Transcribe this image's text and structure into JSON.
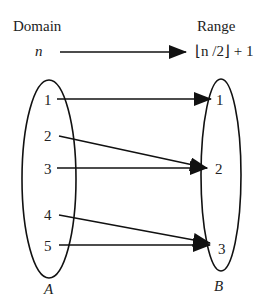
{
  "header": {
    "domain_label": "Domain",
    "range_label": "Range",
    "domain_var": "n",
    "range_expr": "⌊n /2⌋ + 1"
  },
  "sets": {
    "A": {
      "name": "A",
      "elements": [
        "1",
        "2",
        "3",
        "4",
        "5"
      ]
    },
    "B": {
      "name": "B",
      "elements": [
        "1",
        "2",
        "3"
      ]
    }
  },
  "mapping": [
    {
      "from": "1",
      "to": "1"
    },
    {
      "from": "2",
      "to": "2"
    },
    {
      "from": "3",
      "to": "2"
    },
    {
      "from": "4",
      "to": "3"
    },
    {
      "from": "5",
      "to": "3"
    }
  ],
  "colors": {
    "stroke": "#111111",
    "text": "#222222",
    "background": "#ffffff"
  }
}
